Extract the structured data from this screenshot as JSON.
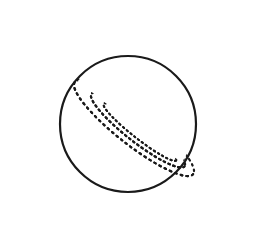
{
  "image": {
    "subject": "Saturn line drawing",
    "width": 263,
    "height": 250,
    "background": "#ffffff",
    "stroke_color": "#1a1a1a"
  },
  "planet": {
    "cx": 128,
    "cy": 124,
    "r": 68,
    "stroke_width": 2.2
  },
  "rings": [
    {
      "name": "outer",
      "cx": 134,
      "cy": 128,
      "rx": 150,
      "ry": 34,
      "angle": 38,
      "dash": "1.6 4.2",
      "width": 2.2
    },
    {
      "name": "middle",
      "cx": 138,
      "cy": 130,
      "rx": 118,
      "ry": 24,
      "angle": 38,
      "dash": "1.6 3.6",
      "width": 2.2
    },
    {
      "name": "inner",
      "cx": 140,
      "cy": 132,
      "rx": 92,
      "ry": 14,
      "angle": 38,
      "dash": "1.4 3.4",
      "width": 2
    }
  ]
}
